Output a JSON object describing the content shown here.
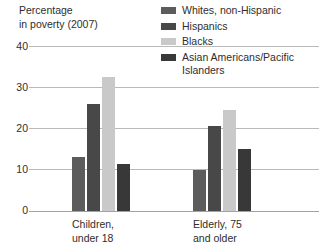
{
  "chart_data": {
    "type": "bar",
    "title_line1": "Percentage",
    "title_line2": "in poverty (2007)",
    "xlabel": "",
    "ylabel": "Percentage in poverty (2007)",
    "ylim": [
      0,
      40
    ],
    "yticks": [
      0,
      10,
      20,
      30,
      40
    ],
    "ytick_labels": [
      "0",
      "10",
      "20",
      "30",
      "40"
    ],
    "grid": true,
    "legend_position": "top-right",
    "categories": [
      "Children, under 18",
      "Elderly, 75 and older"
    ],
    "category_labels": [
      {
        "line1": "Children,",
        "line2": "under 18"
      },
      {
        "line1": "Elderly, 75",
        "line2": "and older"
      }
    ],
    "series": [
      {
        "name": "Whites, non-Hispanic",
        "values": [
          13,
          10
        ],
        "color": "#5c5c5c"
      },
      {
        "name": "Hispanics",
        "values": [
          26,
          20.5
        ],
        "color": "#484848"
      },
      {
        "name": "Blacks",
        "values": [
          32.5,
          24.5
        ],
        "color": "#c9c9c9"
      },
      {
        "name": "Asian Americans/Pacific Islanders",
        "values": [
          11.5,
          15
        ],
        "color": "#383838"
      }
    ]
  },
  "legend": {
    "items": [
      {
        "label": "Whites, non-Hispanic",
        "color": "#5c5c5c"
      },
      {
        "label": "Hispanics",
        "color": "#484848"
      },
      {
        "label": "Blacks",
        "color": "#c9c9c9"
      },
      {
        "label": "Asian Americans/Pacific\nIslanders",
        "color": "#383838"
      }
    ]
  },
  "axis": {
    "caption_line1": "Percentage",
    "caption_line2": "in poverty (2007)",
    "tick_40": "40",
    "tick_30": "30",
    "tick_20": "20",
    "tick_10": "10",
    "tick_0": "0"
  },
  "groups": {
    "g0_line1": "Children,",
    "g0_line2": "under 18",
    "g1_line1": "Elderly, 75",
    "g1_line2": "and older"
  },
  "colors": {
    "gridline": "#b9b9b9",
    "baseline": "#a2a2a2",
    "text": "#2e2e2e",
    "background": "#ffffff"
  }
}
